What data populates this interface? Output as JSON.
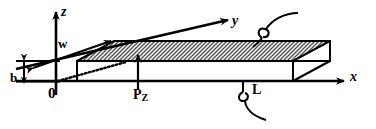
{
  "figure": {
    "kind": "engineering-diagram",
    "colors": {
      "line": "#000000",
      "hatch": "#7a7a7a",
      "background": "#ffffff",
      "face_fill": "#ffffff"
    }
  },
  "axes": [
    {
      "name": "z",
      "label": "z",
      "direction": "up"
    },
    {
      "name": "y",
      "label": "y",
      "direction": "up-right-oblique"
    },
    {
      "name": "x",
      "label": "x",
      "direction": "right"
    }
  ],
  "origin": {
    "label": "0"
  },
  "dimensions": [
    {
      "name": "width",
      "label": "w",
      "arrow": "double-oblique"
    },
    {
      "name": "thickness",
      "label": "b",
      "arrow": "double-vertical"
    },
    {
      "name": "length",
      "label": "L",
      "arrow": "leader-hook"
    }
  ],
  "loads": [
    {
      "name": "point-load",
      "label": "P",
      "subscript": "Z",
      "arrow": "up"
    }
  ],
  "labels": {
    "z": "z",
    "y": "y",
    "x": "x",
    "w": "w",
    "b": "b",
    "origin": "0",
    "length": "L",
    "load": "P",
    "load_subscript": "Z"
  }
}
